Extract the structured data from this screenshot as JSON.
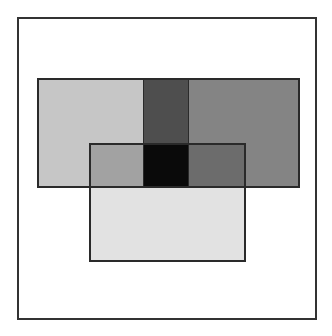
{
  "diagram": {
    "type": "overlapping-rectangles",
    "frame": {
      "x": 17,
      "y": 17,
      "w": 300,
      "h": 303,
      "color": "#ffffff"
    },
    "regions": [
      {
        "name": "left-rect",
        "x": 37,
        "y": 78,
        "w": 106,
        "h": 109,
        "color": "#c6c6c6"
      },
      {
        "name": "middle-band",
        "x": 143,
        "y": 78,
        "w": 46,
        "h": 109,
        "color": "#4e4e4e"
      },
      {
        "name": "right-rect",
        "x": 189,
        "y": 78,
        "w": 110,
        "h": 109,
        "color": "#848484"
      },
      {
        "name": "lower-rect",
        "x": 89,
        "y": 143,
        "w": 157,
        "h": 118,
        "color": "#e2e2e2"
      },
      {
        "name": "left-lower-overlap",
        "x": 89,
        "y": 143,
        "w": 54,
        "h": 44,
        "color": "#a2a2a2"
      },
      {
        "name": "center-overlap",
        "x": 143,
        "y": 143,
        "w": 46,
        "h": 44,
        "color": "#0a0a0a"
      },
      {
        "name": "right-lower-overlap",
        "x": 189,
        "y": 143,
        "w": 57,
        "h": 44,
        "color": "#6c6c6c"
      }
    ],
    "outlines": [
      {
        "name": "top-rect-outline",
        "x": 37,
        "y": 78,
        "w": 263,
        "h": 110
      },
      {
        "name": "lower-rect-outline",
        "x": 89,
        "y": 143,
        "w": 157,
        "h": 119
      },
      {
        "name": "band-left-edge",
        "x": 143,
        "y": 78,
        "w": 1,
        "h": 109
      },
      {
        "name": "band-right-edge",
        "x": 188,
        "y": 78,
        "w": 1,
        "h": 109
      }
    ]
  }
}
